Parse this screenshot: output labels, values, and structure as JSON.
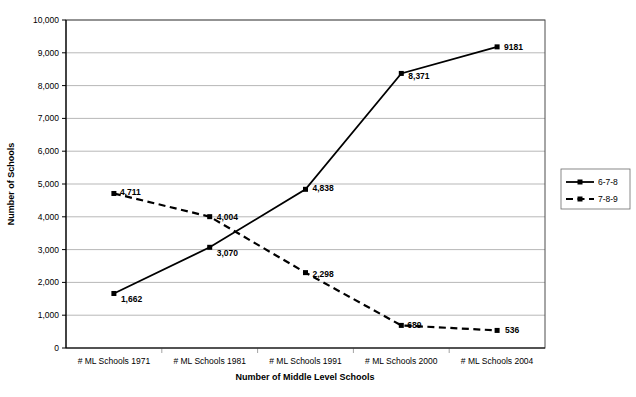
{
  "chart_data": {
    "type": "line",
    "title": "",
    "subtitle": "",
    "xlabel": "Number of Middle Level Schools",
    "ylabel": "Number of Schools",
    "categories": [
      "# ML Schools 1971",
      "# ML Schools 1981",
      "# ML Schools 1991",
      "# ML Schools 2000",
      "# ML Schools 2004"
    ],
    "ylim": [
      0,
      10000
    ],
    "ytick_values": [
      0,
      1000,
      2000,
      3000,
      4000,
      5000,
      6000,
      7000,
      8000,
      9000,
      10000
    ],
    "ytick_labels": [
      "0",
      "1,000",
      "2,000",
      "3,000",
      "4,000",
      "5,000",
      "6,000",
      "7,000",
      "8,000",
      "9,000",
      "10,000"
    ],
    "grid": "horizontal",
    "legend_position": "right",
    "series": [
      {
        "name": "6-7-8",
        "style": "solid",
        "marker": "square",
        "values": [
          1662,
          3070,
          4838,
          8371,
          9181
        ],
        "point_labels": [
          "1,662",
          "3,070",
          "4,838",
          "8,371",
          "9181"
        ],
        "label_offsets": [
          {
            "dx": 7,
            "dy": 9
          },
          {
            "dx": 7,
            "dy": 9
          },
          {
            "dx": 7,
            "dy": 2
          },
          {
            "dx": 7,
            "dy": 6
          },
          {
            "dx": 7,
            "dy": 3
          }
        ]
      },
      {
        "name": "7-8-9",
        "style": "dashed",
        "marker": "square",
        "values": [
          4711,
          4004,
          2298,
          689,
          536
        ],
        "point_labels": [
          "4,711",
          "4,004",
          "2,298",
          "689",
          "536"
        ],
        "label_offsets": [
          {
            "dx": 6,
            "dy": 2
          },
          {
            "dx": 7,
            "dy": 3
          },
          {
            "dx": 7,
            "dy": 4
          },
          {
            "dx": 6,
            "dy": 3
          },
          {
            "dx": 8,
            "dy": 3
          }
        ]
      }
    ]
  },
  "legend": {
    "entries": [
      {
        "label": "6-7-8",
        "style": "solid"
      },
      {
        "label": "7-8-9",
        "style": "dashed"
      }
    ]
  },
  "colors": {
    "series_line": "#000000",
    "gridline": "#9a9a9a",
    "plot_border": "#4d4d4d",
    "background": "#ffffff",
    "text": "#000000"
  }
}
